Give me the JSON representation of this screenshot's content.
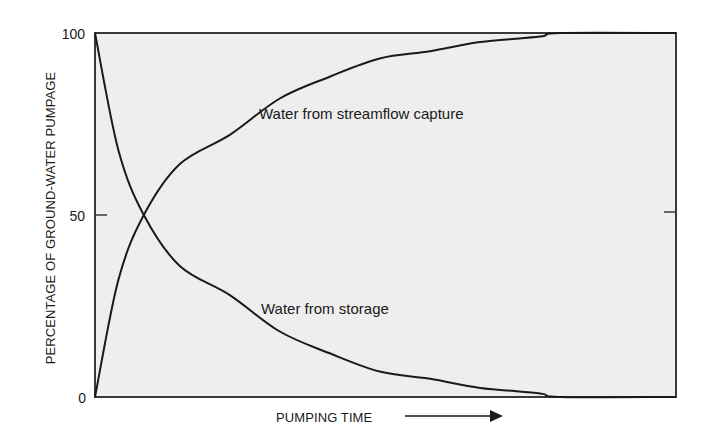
{
  "chart_data": {
    "type": "line",
    "title": "",
    "xlabel": "PUMPING TIME",
    "ylabel": "PERCENTAGE OF GROUND-WATER PUMPAGE",
    "ylim": [
      0,
      100
    ],
    "xlim": [
      0,
      1
    ],
    "yticks": [
      "0",
      "50",
      "100"
    ],
    "ytick_values": [
      0,
      50,
      100
    ],
    "grid": false,
    "legend": "none (inline annotations)",
    "x": [
      0,
      0.04,
      0.084,
      0.146,
      0.232,
      0.318,
      0.404,
      0.49,
      0.577,
      0.663,
      0.766,
      0.8,
      1.0
    ],
    "series": [
      {
        "name": "Water from streamflow capture",
        "values": [
          0,
          32,
          50,
          64,
          72,
          82,
          88,
          93,
          95,
          97.5,
          99,
          100,
          100
        ]
      },
      {
        "name": "Water from storage",
        "values": [
          100,
          68,
          50,
          36,
          28,
          18,
          12,
          7,
          5,
          2.5,
          1,
          0,
          0
        ]
      }
    ],
    "annotations": [
      {
        "text": "Water from streamflow capture",
        "near_series": "Water from streamflow capture"
      },
      {
        "text": "Water from storage",
        "near_series": "Water from storage"
      }
    ],
    "x_axis_arrow": "right-arrow",
    "colors": {
      "plot_background": "#eeeeee",
      "line": "#1a1a1a",
      "frame": "#3a3a3a",
      "page_background": "#ffffff"
    }
  },
  "labels": {
    "y_axis_title": "PERCENTAGE OF GROUND-WATER PUMPAGE",
    "x_axis_title": "PUMPING TIME",
    "tick_100": "100",
    "tick_50": "50",
    "tick_0": "0",
    "annotation_capture": "Water from streamflow capture",
    "annotation_storage": "Water from storage"
  }
}
